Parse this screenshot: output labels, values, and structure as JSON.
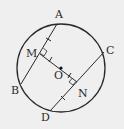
{
  "diagram": {
    "title": "",
    "type": "geometry-circle-chords",
    "colors": {
      "background": "#efefef",
      "stroke": "#2a2a2a"
    },
    "circle": {
      "center_label": "O",
      "cx": 61,
      "cy": 68,
      "r": 44
    },
    "points": [
      {
        "label": "A",
        "x": 57,
        "y": 24,
        "lx": 55,
        "ly": 16
      },
      {
        "label": "B",
        "x": 21,
        "y": 84,
        "lx": 11,
        "ly": 93
      },
      {
        "label": "C",
        "x": 104,
        "y": 52,
        "lx": 106,
        "ly": 51
      },
      {
        "label": "D",
        "x": 50,
        "y": 111,
        "lx": 41,
        "ly": 122
      },
      {
        "label": "M",
        "x": 40,
        "y": 54,
        "lx": 27,
        "ly": 55
      },
      {
        "label": "O",
        "x": 61,
        "y": 68,
        "lx": 54,
        "ly": 81
      },
      {
        "label": "N",
        "x": 77,
        "y": 82,
        "lx": 78,
        "ly": 96
      }
    ],
    "segments": [
      "AB",
      "CD",
      "MN"
    ],
    "right_angles": [
      "OMA",
      "ONC"
    ],
    "equal_marks": [
      "AM",
      "MO",
      "ON",
      "ND"
    ]
  }
}
